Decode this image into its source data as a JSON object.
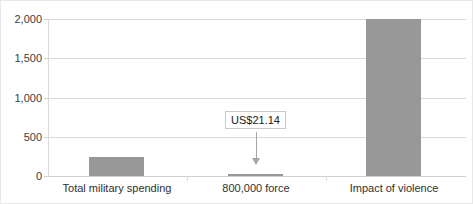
{
  "chart_data": {
    "type": "bar",
    "title": "",
    "xlabel": "",
    "ylabel": "",
    "categories": [
      "Total military spending",
      "800,000 force",
      "Impact of violence"
    ],
    "values": [
      240,
      21.14,
      2000
    ],
    "ylim": [
      0,
      2000
    ],
    "yticks": [
      0,
      500,
      1000,
      1500,
      2000
    ],
    "ytick_labels": [
      "0",
      "500",
      "1,000",
      "1,500",
      "2,000"
    ],
    "grid": true,
    "legend": "none",
    "series_color": "#989898",
    "annotations": [
      {
        "text": "US$21.14",
        "target_category": "800,000 force",
        "arrow": "down"
      }
    ]
  },
  "axis": {
    "tick_0": "0",
    "tick_500": "500",
    "tick_1000": "1,000",
    "tick_1500": "1,500",
    "tick_2000": "2,000"
  },
  "categories": {
    "cat_0": "Total military spending",
    "cat_1": "800,000 force",
    "cat_2": "Impact of violence"
  },
  "annotation": {
    "label": "US$21.14"
  }
}
